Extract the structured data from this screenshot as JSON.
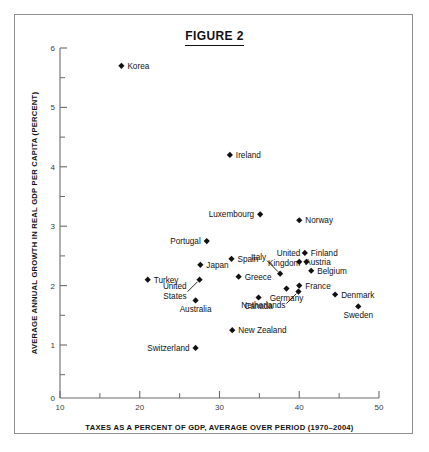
{
  "figure": {
    "title": "FIGURE 2"
  },
  "chart_data": {
    "type": "scatter",
    "title": "FIGURE 2",
    "xlabel": "TAXES AS A PERCENT OF GDP, AVERAGE OVER PERIOD (1970–2004)",
    "ylabel": "AVERAGE ANNUAL GROWTH IN REAL GDP PER CAPITA (PERCENT)",
    "xlim": [
      10,
      50
    ],
    "ylim": [
      0,
      6
    ],
    "x_major_ticks": [
      "10",
      "20",
      "30",
      "40",
      "50"
    ],
    "x_minor_step": 5,
    "y_major_ticks": [
      "1",
      "2",
      "3",
      "4",
      "5",
      "6"
    ],
    "y_origin_label": "0",
    "y_minor_step": 0.5,
    "grid": false,
    "legend": "none",
    "marker_shape": "diamond",
    "marker_color": "#111111",
    "points": [
      {
        "label": "Korea",
        "x": 17.7,
        "y": 5.7,
        "label_pos": "right"
      },
      {
        "label": "Ireland",
        "x": 31.3,
        "y": 4.2,
        "label_pos": "right"
      },
      {
        "label": "Luxembourg",
        "x": 35.1,
        "y": 3.2,
        "label_pos": "left"
      },
      {
        "label": "Norway",
        "x": 40.0,
        "y": 3.1,
        "label_pos": "right"
      },
      {
        "label": "Portugal",
        "x": 28.4,
        "y": 2.75,
        "label_pos": "left"
      },
      {
        "label": "Finland",
        "x": 40.7,
        "y": 2.55,
        "label_pos": "right"
      },
      {
        "label": "Spain",
        "x": 31.5,
        "y": 2.45,
        "label_pos": "right"
      },
      {
        "label": "Austria",
        "x": 40.0,
        "y": 2.4,
        "label_pos": "right"
      },
      {
        "label": "United Kingdom",
        "x": 40.9,
        "y": 2.4,
        "label_pos": "left2"
      },
      {
        "label": "Japan",
        "x": 27.6,
        "y": 2.35,
        "label_pos": "right"
      },
      {
        "label": "Belgium",
        "x": 41.5,
        "y": 2.25,
        "label_pos": "right"
      },
      {
        "label": "Italy",
        "x": 37.6,
        "y": 2.2,
        "label_pos": "leader-up-left"
      },
      {
        "label": "Greece",
        "x": 32.4,
        "y": 2.15,
        "label_pos": "right"
      },
      {
        "label": "United States",
        "x": 27.5,
        "y": 2.1,
        "label_pos": "leader-down-left"
      },
      {
        "label": "Turkey",
        "x": 21.0,
        "y": 2.1,
        "label_pos": "right"
      },
      {
        "label": "France",
        "x": 40.0,
        "y": 2.0,
        "label_pos": "right"
      },
      {
        "label": "Germany",
        "x": 38.4,
        "y": 1.95,
        "label_pos": "below"
      },
      {
        "label": "Netherlands",
        "x": 39.9,
        "y": 1.9,
        "label_pos": "leader-down-left"
      },
      {
        "label": "Denmark",
        "x": 44.5,
        "y": 1.85,
        "label_pos": "right"
      },
      {
        "label": "Canada",
        "x": 34.9,
        "y": 1.8,
        "label_pos": "below"
      },
      {
        "label": "Australia",
        "x": 27.0,
        "y": 1.75,
        "label_pos": "below"
      },
      {
        "label": "Sweden",
        "x": 47.4,
        "y": 1.65,
        "label_pos": "below"
      },
      {
        "label": "New Zealand",
        "x": 31.6,
        "y": 1.25,
        "label_pos": "right"
      },
      {
        "label": "Switzerland",
        "x": 27.0,
        "y": 0.95,
        "label_pos": "left"
      }
    ]
  }
}
